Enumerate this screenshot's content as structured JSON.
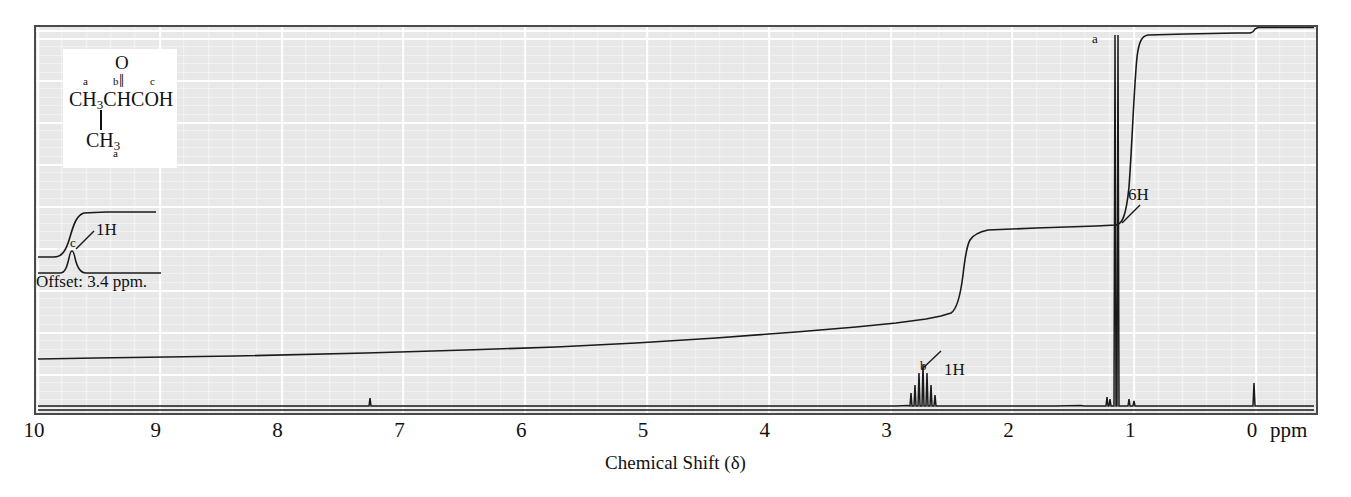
{
  "chart_data": {
    "type": "line",
    "title": "",
    "xlabel": "Chemical Shift (δ)",
    "ylabel": "",
    "x_unit": "ppm",
    "xlim": [
      10.55,
      -0.55
    ],
    "x_reversed": true,
    "grid": true,
    "axis_ticks": [
      {
        "value": 10,
        "label": "10"
      },
      {
        "value": 9,
        "label": "9"
      },
      {
        "value": 8,
        "label": "8"
      },
      {
        "value": 7,
        "label": "7"
      },
      {
        "value": 6,
        "label": "6"
      },
      {
        "value": 5,
        "label": "5"
      },
      {
        "value": 4,
        "label": "4"
      },
      {
        "value": 3,
        "label": "3"
      },
      {
        "value": 2,
        "label": "2"
      },
      {
        "value": 1,
        "label": "1"
      },
      {
        "value": 0,
        "label": "0"
      }
    ],
    "peaks": [
      {
        "id": "a",
        "label": "a",
        "shift_ppm": 1.2,
        "integration": "6H",
        "multiplicity": "doublet",
        "relative_height": 1.0,
        "lines": [
          1.17,
          1.23
        ]
      },
      {
        "id": "b",
        "label": "b",
        "shift_ppm": 2.6,
        "integration": "1H",
        "multiplicity": "septet",
        "relative_height": 0.14,
        "lines": [
          2.52,
          2.55,
          2.58,
          2.61,
          2.64,
          2.67,
          2.7
        ]
      },
      {
        "id": "c",
        "label": "c",
        "shift_ppm": 9.7,
        "integration": "1H",
        "multiplicity": "singlet",
        "relative_height": 0.04,
        "offset_ppm": 3.4,
        "note": "drawn on offset trace"
      },
      {
        "id": "solvent",
        "label": "",
        "shift_ppm": 7.26,
        "integration": "",
        "multiplicity": "singlet",
        "relative_height": 0.02
      },
      {
        "id": "tms",
        "label": "",
        "shift_ppm": 0.0,
        "integration": "",
        "multiplicity": "singlet",
        "relative_height": 0.03
      }
    ],
    "integration_steps": [
      {
        "peak": "c",
        "shift_ppm": 9.7,
        "height": "1H"
      },
      {
        "peak": "b",
        "shift_ppm": 2.6,
        "height": "1H"
      },
      {
        "peak": "a",
        "shift_ppm": 1.2,
        "height": "6H"
      }
    ]
  },
  "annotations": {
    "offset_note": "Offset: 3.4 ppm.",
    "peak_a_letter": "a",
    "peak_a_integral": "6H",
    "peak_b_letter": "b",
    "peak_b_integral": "1H",
    "peak_c_letter": "c",
    "peak_c_integral": "1H"
  },
  "structure": {
    "oxygen": "O",
    "double_bond": "‖",
    "label_a_top": "a",
    "label_b_top": "b",
    "label_c_top": "c",
    "main_chain_pre": "CH",
    "main_chain_sub": "3",
    "main_chain_post": "CHCOH",
    "branch_pre": "CH",
    "branch_sub": "3",
    "label_a_bottom": "a",
    "compound": "CH3CHCOH with CH3 branch"
  },
  "axis": {
    "title": "Chemical Shift (δ)",
    "unit_label": "ppm"
  },
  "colors": {
    "plot_background": "#e8e8e8",
    "grid_line": "#ffffff",
    "trace": "#1a1a1a",
    "border": "#4a4a4a",
    "page_background": "#ffffff"
  }
}
